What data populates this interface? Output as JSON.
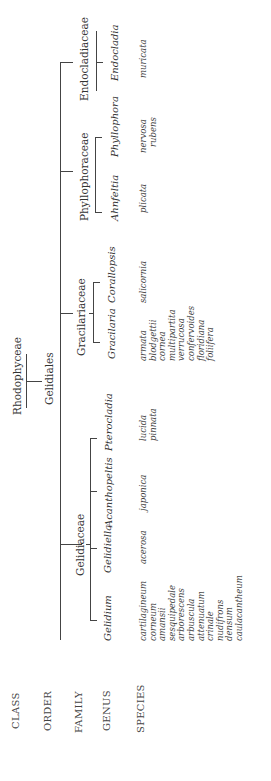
{
  "ranks": [
    "CLASS",
    "ORDER",
    "FAMILY",
    "GENUS",
    "SPECIES"
  ],
  "class": {
    "name": "Rhodophyceae"
  },
  "order": {
    "name": "Gelidiales"
  },
  "families": [
    {
      "name": "Gelidiaceae",
      "genera": [
        {
          "name": "Gelidium",
          "species": [
            "cartilagineum",
            "corneum",
            "amansii",
            "sesquipedale",
            "arborescens",
            "arbuscula",
            "attenuatum",
            "crinale",
            "nudifrons",
            "densum",
            "caulacantheum"
          ]
        },
        {
          "name": "Gelidiella",
          "species": [
            "acerosa"
          ]
        },
        {
          "name": "Acanthopeltis",
          "species": [
            "japonica"
          ]
        },
        {
          "name": "Pterocladia",
          "species": [
            "lucida",
            "pinnata"
          ]
        }
      ]
    },
    {
      "name": "Gracilariaceae",
      "genera": [
        {
          "name": "Gracilaria",
          "species": [
            "armata",
            "blodgettii",
            "cornea",
            "multipartita",
            "verrucosa",
            "confervoides",
            "floridiana",
            "foliifera"
          ]
        },
        {
          "name": "Corallopsis",
          "species": [
            "salicornia"
          ]
        }
      ]
    },
    {
      "name": "Phyllophoraceae",
      "genera": [
        {
          "name": "Ahnfeltia",
          "species": [
            "plicata"
          ]
        },
        {
          "name": "Phyllophora",
          "species": [
            "nervosa",
            "rubens"
          ]
        }
      ]
    },
    {
      "name": "Endocladiaceae",
      "genera": [
        {
          "name": "Endocladia",
          "species": [
            "muricata"
          ]
        }
      ]
    }
  ]
}
